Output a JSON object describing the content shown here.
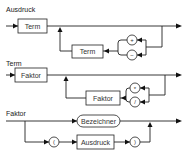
{
  "diagram": {
    "type": "syntax-diagram",
    "rules": [
      {
        "name": "Ausdruck",
        "first": "Term",
        "loop_nonterminal": "Term",
        "operators": [
          "+",
          "−"
        ]
      },
      {
        "name": "Term",
        "first": "Faktor",
        "loop_nonterminal": "Faktor",
        "operators": [
          "*",
          "/"
        ]
      },
      {
        "name": "Faktor",
        "alternative_1": "Bezeichner",
        "alternative_2": {
          "open": "(",
          "nonterminal": "Ausdruck",
          "close": ")"
        }
      }
    ]
  }
}
